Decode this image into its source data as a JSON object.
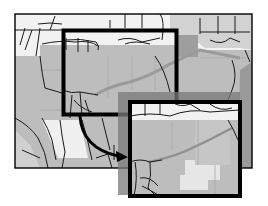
{
  "figure": {
    "type": "map-zoom-inset-diagram"
  },
  "colors": {
    "background": "#ffffff",
    "light_parcel": "#f2f2f2",
    "medium_parcel": "#bdbdbd",
    "dark_parcel": "#a6a6a6",
    "pale_parcel": "#e6e6e6",
    "road": "#1a1a1a",
    "highway": "#9a9a9a",
    "frame": "#000000",
    "shadow": "#7a7a7a"
  },
  "overview_map": {
    "x": 15,
    "y": 14,
    "width": 237,
    "height": 154
  },
  "selection_box": {
    "x": 62,
    "y": 29,
    "width": 116,
    "height": 87
  },
  "inset_box": {
    "x": 128,
    "y": 100,
    "width": 114,
    "height": 98
  },
  "arrow": {
    "from": [
      80,
      116
    ],
    "to": [
      126,
      157
    ]
  }
}
